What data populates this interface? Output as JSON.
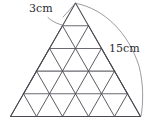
{
  "figure": {
    "kind": "geometry-diagram",
    "shape": "equilateral-triangle-subdivided",
    "rows": 5,
    "small_triangle_count": 25,
    "outline_color": "#4a4a52",
    "grid_color": "#6a6a70",
    "leader_color": "#7a7a80",
    "background": "#ffffff",
    "labels": {
      "top_side": "3cm",
      "full_side": "15cm"
    },
    "annotations": [
      {
        "name": "top-small-side",
        "text": "3cm",
        "points_to": "upper-left edge of topmost small triangle"
      },
      {
        "name": "full-right-side",
        "text": "15cm",
        "points_to": "right side of the large triangle, apex to bottom-right corner"
      }
    ],
    "geometry": {
      "apex": [
        75.5,
        3.0
      ],
      "bottom_left": [
        10.5,
        116.5
      ],
      "bottom_right": [
        140.5,
        116.5
      ],
      "row_y": [
        3.0,
        25.7,
        48.4,
        71.1,
        93.8,
        116.5
      ]
    }
  }
}
